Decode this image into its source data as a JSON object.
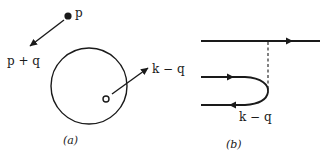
{
  "panel_a": {
    "caption": "(a)",
    "particle_label": "p",
    "outgoing_label": "p + q",
    "hole_momentum_label": "k − q",
    "elements": [
      "filled-particle-dot",
      "fermi-sphere",
      "hole-open-circle"
    ]
  },
  "panel_b": {
    "caption": "(b)",
    "loop_label": "k − q",
    "elements": [
      "particle-line",
      "interaction-dashed-line",
      "particle-hole-bubble"
    ]
  },
  "colors": {
    "ink": "#1a1a1a",
    "background": "#ffffff"
  }
}
